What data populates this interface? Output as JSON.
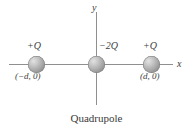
{
  "figure": {
    "caption": "Quadrupole",
    "background_color": "#ffffff",
    "axes": {
      "x_label": "x",
      "y_label": "y",
      "line_color": "#8f8f8f"
    },
    "charges": [
      {
        "id": "left",
        "magnitude_label": "+Q",
        "coordinate_label": "(−d, 0)",
        "sphere_color": "#a9a9a9"
      },
      {
        "id": "center",
        "magnitude_label": "−2Q",
        "coordinate_label": "",
        "sphere_color": "#a9a9a9"
      },
      {
        "id": "right",
        "magnitude_label": "+Q",
        "coordinate_label": "(d, 0)",
        "sphere_color": "#a9a9a9"
      }
    ]
  }
}
